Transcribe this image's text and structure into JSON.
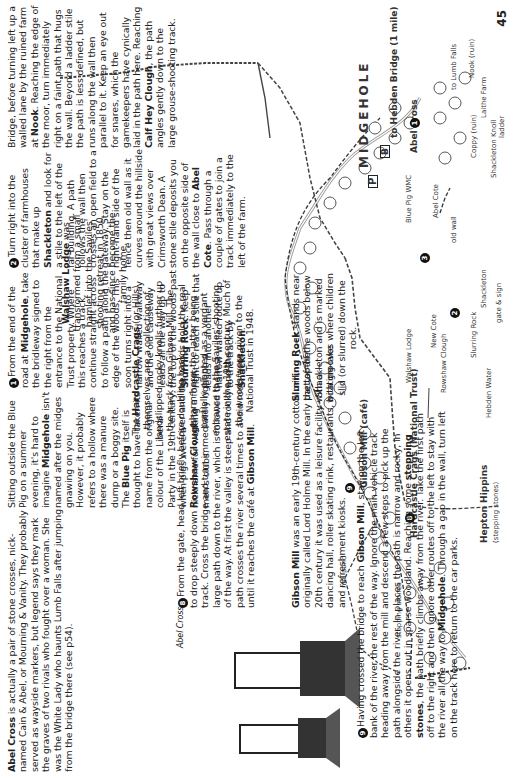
{
  "page": {
    "page_number": "45",
    "orientation": "rotated 90 degrees counter-clockwise"
  },
  "text_blocks": {
    "abel_cross": {
      "title": "Abel Cross",
      "body": " is actually a pair of stone crosses, nick-named Cain & Abel, or Mourning & Vanity. They probably served as wayside markers, but legend says they mark the graves of two rivals who fought over a woman. She was the White Lady who haunts Lumb Falls after jumping from the bridge there (see p54)."
    },
    "drawing_caption": "Abel Cross",
    "step_8": {
      "number": "8",
      "pre": "From the gate, head left briefly before doubling back to drop steeply down ",
      "bold1": "Rowshaw Clough",
      "mid": " to a forest track. Cross the bridge and turn immediately right on a large path down to the river, which is followed the rest of the way. At first the valley is steep and rocky and the path crosses the river several times to avoid rock faces until it reaches the café at ",
      "bold2": "Gibson Mill",
      "post": "."
    },
    "gibson_mill": {
      "title": "Gibson Mill",
      "body": " was an early 19th-century cotton mill, originally called Lord Holme Mill. In the early part of the 20th century it was used as a leisure facility with a dancing hall, roller skating rink, restaurants, boating lake and refreshment kiosks."
    },
    "step_9": {
      "number": "9",
      "pre": "Having crossed the bridge to reach ",
      "bold1": "Gibson Mill",
      "mid1": ", stay on the left bank of the river the rest of the way. Ignore the main vehicle track heading away from the mill and descend a few steps to pick up the path alongside the river. In places the path is narrow and rocky, in others it opens out in sparse woodland. Reaching some ",
      "bold2": "stepping stones",
      "mid2": ", the path briefly climbs away from the river. Take the first path off to the right and then ignore other routes off to the left to stay with the river all the way to ",
      "bold3": "Midgehole",
      "post": ". Through a gap in the wall, turn left on the track here to return to the car parks."
    },
    "walshaw_lodge": {
      "title": "Walshaw Lodge",
      "body": " was transformed from a small hamlet into the Saviles' shooting retreat in 1850 and has since become the family home."
    },
    "hardcastle_crags": {
      "pre": "The ",
      "title": "Hardcastle Crags",
      "body": " (or Hills) themselves are a collection of landslipped rocky knolls further up the track from Gibson Mill. The river and the woods hold the real charm here, the latter being partially planted as a verdant entrance to the Saviles' shooting estate in the 19th century. Much of the woods were given to the National Trust in 1948."
    },
    "slurring_rock": {
      "title": "Slurring Rock",
      "body": " stands near the top of the woods below Shackleton and is marked with grooves where children slid (or slurred) down the rock."
    },
    "intro_continued": {
      "pre": "Bridge, before turning left up a walled lane by the ruined farm at ",
      "bold1": "Nook",
      "mid": ". Reaching the edge of the moor, turn immediately right on a faint path that hugs the wall. Beyond a ladder stile the path is less defined, but runs along the wall then parallel to it. Keep an eye out for snares, which the gamekeepers have cynically laid in the path here. Reaching ",
      "bold2": "Calf Hey Clough",
      "post": ", the path angles gently down to the large grouse-shooting track."
    },
    "step_2": {
      "number": "2",
      "pre": "Turn right into the cluster of farmhouses that make up ",
      "bold1": "Shackleton",
      "mid": " and look for a stile to the left of the far building. A path follows the wall then crosses an open field to a gateway. Stay on the right-hand side of the fence then old wall as it curves around the hillside with great views over Crimsworth Dean. A stone stile deposits you on the opposite side of the wall close to ",
      "bold2": "Abel Cote",
      "post": ". Pass through a couple of gates to join a track immediately to the left of the farm."
    },
    "step_1": {
      "number": "1",
      "pre": "From the end of the road at ",
      "bold1": "Midgehole",
      "mid1": ", take the bridleway signed to the right from the entrance to the National Trust property. Where this reaches a track, continue straight across to follow a path along the edge of the woods. This soon turns right into a narrow walled walkway and the old causeway leads all the way up to the top of the woods past ",
      "bold2": "Slurring Rock",
      "mid2": ". Keep right to reach a stile that leads into another narrow walled route up to the track by ",
      "bold3": "Shackleton",
      "post": "."
    },
    "blue_pig": {
      "pre": "Sitting outside the Blue Pig on a summer evening, it's hard to imagine ",
      "bold1": "Midgehole",
      "mid": " isn't named after the midges gnawing on you. However, it probably refers to a hollow where there was a manure dump or a boggy site. The ",
      "bold2": "Blue Pig",
      "post": " itself is thought to have taken its name from the original colour of the Liberal Party in the 19th century, when pigs were a nickname for working men's clubs."
    }
  },
  "map_labels": {
    "to_lumb_falls": "to Lumb Falls",
    "nook": "Nook (ruin)",
    "sign_gate": "sign & gate",
    "sign": "sign",
    "laithe_farm": "Laithe Farm",
    "ladder": "ladder",
    "shackleton_knoll": "Shackleton Knoll",
    "post": "post",
    "gate": "gate",
    "coppy": "Coppy (ruin)",
    "gates": "gates",
    "abel_cross": "Abel Cross",
    "abel_cote": "Abel Cote",
    "stile": "stile",
    "old_wall": "old wall",
    "new_cote": "New Cote",
    "walshaw_lodge": "Walshaw Lodge",
    "rowshaw_clough": "Rowshaw Clough",
    "bridge": "bridge",
    "hebden_water": "Hebden Water",
    "gibson_mill": "Gibson Mill (café)",
    "mill_pond": "mill pond",
    "stepping_stones": "stepping stones",
    "steps": "steps",
    "hardcastle_crags_nt": "Hardcastle Crags (National Trust)",
    "hepton_hippins": "Hepton Hippins",
    "hepton_hippins_sub": "(stepping stones)",
    "shackleton": "Shackleton",
    "slurring_rock": "Slurring Rock",
    "gate_sign": "gate & sign",
    "causeway": "causeway",
    "midgehole": "MIDGEHOLE",
    "to_hebden_bridge": "to Hebden Bridge (1 mile)",
    "blue_pig_wmc": "Blue Pig WMC",
    "parking": "P",
    "bus": "B",
    "waypoints": [
      "1",
      "2",
      "3",
      "8",
      "9"
    ]
  }
}
